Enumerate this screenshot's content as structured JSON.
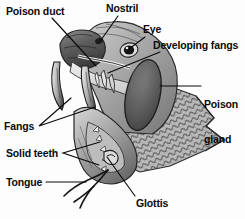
{
  "figure": {
    "style": "grayscale halftone anatomical illustration",
    "background_color": "#fdfdfd",
    "line_color": "#0a0a0a",
    "text_color": "#0a0a0a"
  },
  "labels": [
    {
      "id": "poison-duct",
      "text": "Poison duct",
      "x": 6,
      "y": 6,
      "align": "left"
    },
    {
      "id": "nostril",
      "text": "Nostril",
      "x": 106,
      "y": 3,
      "align": "left"
    },
    {
      "id": "eye",
      "text": "Eye",
      "x": 143,
      "y": 24,
      "align": "left"
    },
    {
      "id": "developing-fangs",
      "text": "Developing fangs",
      "x": 153,
      "y": 40,
      "align": "left"
    },
    {
      "id": "poison-gland",
      "text": "Poison gland",
      "x": 204,
      "y": 76,
      "align": "left",
      "lines": [
        "Poison",
        "gland"
      ]
    },
    {
      "id": "fangs",
      "text": "Fangs",
      "x": 4,
      "y": 121,
      "align": "left"
    },
    {
      "id": "solid-teeth",
      "text": "Solid teeth",
      "x": 6,
      "y": 148,
      "align": "left"
    },
    {
      "id": "tongue",
      "text": "Tongue",
      "x": 6,
      "y": 177,
      "align": "left"
    },
    {
      "id": "glottis",
      "text": "Glottis",
      "x": 136,
      "y": 198,
      "align": "left"
    }
  ],
  "leader_lines": [
    {
      "id": "poison-duct-leader",
      "from": [
        52,
        18
      ],
      "to": [
        96,
        66
      ]
    },
    {
      "id": "nostril-leader",
      "from": [
        118,
        16
      ],
      "to": [
        101,
        40
      ]
    },
    {
      "id": "eye-leader",
      "from": [
        145,
        37
      ],
      "to": [
        128,
        49
      ]
    },
    {
      "id": "developing-fangs-leader",
      "from": [
        160,
        52
      ],
      "to": [
        108,
        73
      ]
    },
    {
      "id": "poison-gland-leader",
      "from": [
        201,
        86
      ],
      "to": [
        160,
        86
      ]
    },
    {
      "id": "fangs-leader-a",
      "from": [
        39,
        126
      ],
      "to": [
        71,
        98
      ]
    },
    {
      "id": "fangs-leader-b",
      "from": [
        39,
        126
      ],
      "to": [
        95,
        106
      ]
    },
    {
      "id": "solid-teeth-leader-a",
      "from": [
        63,
        153
      ],
      "to": [
        100,
        144
      ]
    },
    {
      "id": "solid-teeth-leader-b",
      "from": [
        63,
        153
      ],
      "to": [
        99,
        164
      ]
    },
    {
      "id": "glottis-leader",
      "from": [
        135,
        196
      ],
      "to": [
        106,
        157
      ]
    },
    {
      "id": "tongue-leader",
      "from": [
        46,
        182
      ],
      "to": [
        86,
        182
      ]
    }
  ],
  "anatomy_parts": [
    "poison duct",
    "nostril",
    "eye",
    "developing fangs",
    "poison gland",
    "fangs",
    "solid teeth",
    "tongue",
    "glottis"
  ]
}
